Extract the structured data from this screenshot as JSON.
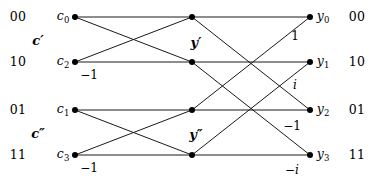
{
  "figure": {
    "width": 379,
    "height": 182,
    "background": "#ffffff",
    "line_color": "#1a1a1a",
    "node_color": "#000000"
  },
  "left_bits": [
    {
      "text": "00",
      "x": 18,
      "y": 17
    },
    {
      "text": "10",
      "x": 18,
      "y": 62
    },
    {
      "text": "01",
      "x": 18,
      "y": 110
    },
    {
      "text": "11",
      "x": 18,
      "y": 155
    }
  ],
  "right_bits": [
    {
      "text": "00",
      "x": 357,
      "y": 17
    },
    {
      "text": "10",
      "x": 357,
      "y": 62
    },
    {
      "text": "01",
      "x": 357,
      "y": 110
    },
    {
      "text": "11",
      "x": 357,
      "y": 155
    }
  ],
  "group_labels": [
    {
      "text": "c",
      "prime": "′",
      "x": 38,
      "y": 40
    },
    {
      "text": "c",
      "prime": "″",
      "x": 38,
      "y": 133
    },
    {
      "text": "y",
      "prime": "′",
      "x": 196,
      "y": 42
    },
    {
      "text": "y",
      "prime": "″",
      "x": 196,
      "y": 134
    }
  ],
  "input_nodes": [
    {
      "name": "c",
      "index": "0",
      "x": 75,
      "y": 17,
      "label_x": 63,
      "label_y": 16
    },
    {
      "name": "c",
      "index": "2",
      "x": 75,
      "y": 62,
      "label_x": 63,
      "label_y": 61
    },
    {
      "name": "c",
      "index": "1",
      "x": 75,
      "y": 110,
      "label_x": 63,
      "label_y": 109
    },
    {
      "name": "c",
      "index": "3",
      "x": 75,
      "y": 155,
      "label_x": 63,
      "label_y": 154
    }
  ],
  "middle_nodes": [
    {
      "x": 192,
      "y": 17
    },
    {
      "x": 192,
      "y": 62
    },
    {
      "x": 192,
      "y": 110
    },
    {
      "x": 192,
      "y": 155
    }
  ],
  "output_nodes": [
    {
      "name": "y",
      "index": "0",
      "x": 310,
      "y": 17,
      "label_x": 323,
      "label_y": 16
    },
    {
      "name": "y",
      "index": "1",
      "x": 310,
      "y": 62,
      "label_x": 323,
      "label_y": 61
    },
    {
      "name": "y",
      "index": "2",
      "x": 310,
      "y": 110,
      "label_x": 323,
      "label_y": 109
    },
    {
      "name": "y",
      "index": "3",
      "x": 310,
      "y": 155,
      "label_x": 323,
      "label_y": 154
    }
  ],
  "edges": [
    {
      "from": [
        75,
        17
      ],
      "to": [
        192,
        17
      ],
      "id": "c0-m0"
    },
    {
      "from": [
        75,
        17
      ],
      "to": [
        192,
        62
      ],
      "id": "c0-m1"
    },
    {
      "from": [
        75,
        62
      ],
      "to": [
        192,
        17
      ],
      "id": "c2-m0"
    },
    {
      "from": [
        75,
        62
      ],
      "to": [
        192,
        62
      ],
      "id": "c2-m1"
    },
    {
      "from": [
        75,
        110
      ],
      "to": [
        192,
        110
      ],
      "id": "c1-m2"
    },
    {
      "from": [
        75,
        110
      ],
      "to": [
        192,
        155
      ],
      "id": "c1-m3"
    },
    {
      "from": [
        75,
        155
      ],
      "to": [
        192,
        110
      ],
      "id": "c3-m2"
    },
    {
      "from": [
        75,
        155
      ],
      "to": [
        192,
        155
      ],
      "id": "c3-m3"
    },
    {
      "from": [
        192,
        17
      ],
      "to": [
        310,
        17
      ],
      "id": "m0-y0"
    },
    {
      "from": [
        192,
        17
      ],
      "to": [
        310,
        110
      ],
      "id": "m0-y2"
    },
    {
      "from": [
        192,
        62
      ],
      "to": [
        310,
        62
      ],
      "id": "m1-y1"
    },
    {
      "from": [
        192,
        62
      ],
      "to": [
        310,
        155
      ],
      "id": "m1-y3"
    },
    {
      "from": [
        192,
        110
      ],
      "to": [
        310,
        17
      ],
      "id": "m2-y0"
    },
    {
      "from": [
        192,
        110
      ],
      "to": [
        310,
        110
      ],
      "id": "m2-y2"
    },
    {
      "from": [
        192,
        155
      ],
      "to": [
        310,
        62
      ],
      "id": "m3-y1"
    },
    {
      "from": [
        192,
        155
      ],
      "to": [
        310,
        155
      ],
      "id": "m3-y3"
    }
  ],
  "weights": [
    {
      "text": "−1",
      "x": 89,
      "y": 75,
      "italic": false
    },
    {
      "text": "−1",
      "x": 89,
      "y": 168,
      "italic": false
    },
    {
      "text": "1",
      "x": 295,
      "y": 36,
      "italic": false
    },
    {
      "text": "i",
      "x": 295,
      "y": 85,
      "italic": true
    },
    {
      "text": "−1",
      "x": 292,
      "y": 126,
      "italic": false
    },
    {
      "text": "−i",
      "x": 292,
      "y": 170,
      "italic": true
    }
  ]
}
